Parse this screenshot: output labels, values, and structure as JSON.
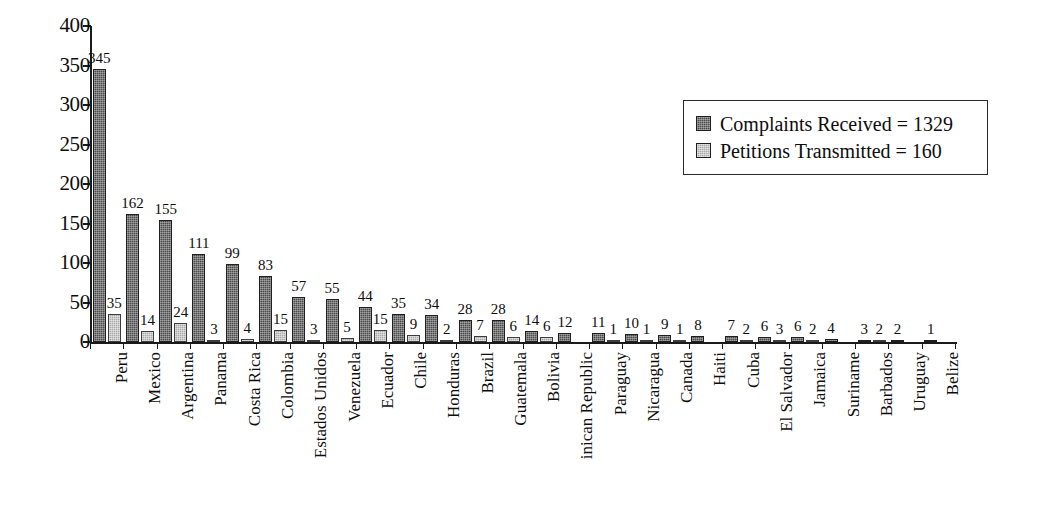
{
  "chart_data": {
    "type": "bar",
    "title": "",
    "xlabel": "",
    "ylabel": "",
    "ylim": [
      0,
      400
    ],
    "yticks": [
      0,
      50,
      100,
      150,
      200,
      250,
      300,
      350,
      400
    ],
    "grid": false,
    "legend_position": "top-right",
    "categories": [
      "Peru",
      "Mexico",
      "Argentina",
      "Panama",
      "Costa Rica",
      "Colombia",
      "Estados Unidos",
      "Venezuela",
      "Ecuador",
      "Chile",
      "Honduras",
      "Brazil",
      "Guatemala",
      "Bolivia",
      "inican Republic",
      "Paraguay",
      "Nicaragua",
      "Canada",
      "Haiti",
      "Cuba",
      "El Salvador",
      "Jamaica",
      "Suriname",
      "Barbados",
      "Uruguay",
      "Belize"
    ],
    "series": [
      {
        "name": "Complaints Received",
        "total": 1329,
        "color": "#4a4a4a",
        "values": [
          345,
          162,
          155,
          111,
          99,
          83,
          57,
          55,
          44,
          35,
          34,
          28,
          28,
          14,
          12,
          11,
          10,
          9,
          8,
          7,
          6,
          6,
          4,
          3,
          2,
          1
        ]
      },
      {
        "name": "Petitions Transmitted",
        "total": 160,
        "color": "#a9a9a9",
        "values": [
          35,
          14,
          24,
          3,
          4,
          15,
          3,
          5,
          15,
          9,
          2,
          7,
          6,
          6,
          null,
          1,
          1,
          1,
          null,
          2,
          3,
          2,
          null,
          2,
          null,
          null
        ]
      }
    ]
  },
  "legend": {
    "items": [
      {
        "label": "Complaints Received = 1329",
        "swatch": "dark"
      },
      {
        "label": "Petitions Transmitted = 160",
        "swatch": "light"
      }
    ]
  }
}
